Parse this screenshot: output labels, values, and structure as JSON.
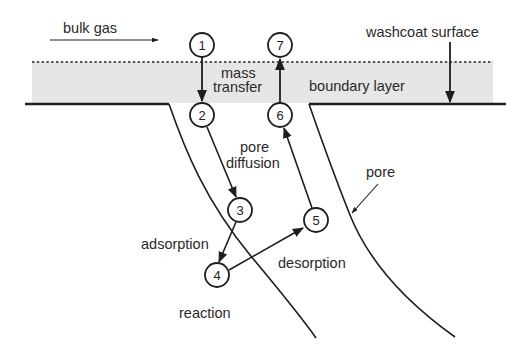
{
  "diagram": {
    "type": "catalytic-process-schematic",
    "colors": {
      "boundary_layer_fill": "#e6e6e6",
      "line": "#1e1e1e",
      "text": "#2a2a2a",
      "background": "#ffffff"
    },
    "labels": {
      "bulk_gas": "bulk gas",
      "washcoat_surface": "washcoat surface",
      "mass_transfer_line1": "mass",
      "mass_transfer_line2": "transfer",
      "boundary_layer": "boundary layer",
      "pore_diffusion_line1": "pore",
      "pore_diffusion_line2": "diffusion",
      "pore": "pore",
      "adsorption": "adsorption",
      "desorption": "desorption",
      "reaction": "reaction"
    },
    "steps": [
      {
        "id": "1",
        "label": "1"
      },
      {
        "id": "2",
        "label": "2"
      },
      {
        "id": "3",
        "label": "3"
      },
      {
        "id": "4",
        "label": "4"
      },
      {
        "id": "5",
        "label": "5"
      },
      {
        "id": "6",
        "label": "6"
      },
      {
        "id": "7",
        "label": "7"
      }
    ],
    "edges": [
      {
        "from": "1",
        "to": "2",
        "label": "mass transfer"
      },
      {
        "from": "2",
        "to": "3",
        "label": "pore diffusion"
      },
      {
        "from": "3",
        "to": "4",
        "label": "adsorption"
      },
      {
        "from": "4",
        "to": "5",
        "label": "desorption"
      },
      {
        "from": "5",
        "to": "6",
        "label": "pore diffusion"
      },
      {
        "from": "6",
        "to": "7",
        "label": "mass transfer"
      }
    ]
  }
}
